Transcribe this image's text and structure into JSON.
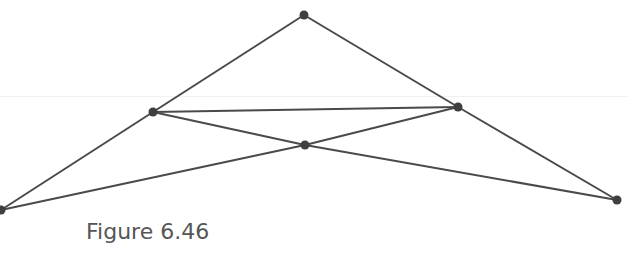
{
  "figure": {
    "caption": "Figure 6.46",
    "line_color": "#4a4a4a",
    "point_color": "#3f3f3f",
    "caption_color": "#555555"
  },
  "diagram": {
    "points": [
      {
        "id": "apex",
        "x": 304,
        "y": 15
      },
      {
        "id": "left-mid",
        "x": 153,
        "y": 112
      },
      {
        "id": "right-mid",
        "x": 458,
        "y": 107
      },
      {
        "id": "center",
        "x": 305,
        "y": 145
      },
      {
        "id": "bottom-left",
        "x": 1,
        "y": 210
      },
      {
        "id": "bottom-right",
        "x": 617,
        "y": 200
      }
    ],
    "segments": [
      [
        "apex",
        "left-mid"
      ],
      [
        "left-mid",
        "bottom-left"
      ],
      [
        "apex",
        "right-mid"
      ],
      [
        "right-mid",
        "bottom-right"
      ],
      [
        "left-mid",
        "right-mid"
      ],
      [
        "left-mid",
        "center"
      ],
      [
        "center",
        "bottom-right"
      ],
      [
        "bottom-left",
        "center"
      ],
      [
        "center",
        "right-mid"
      ]
    ]
  }
}
